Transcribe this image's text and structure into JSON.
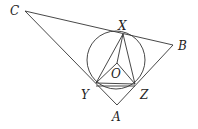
{
  "figure": {
    "labels": {
      "A": "A",
      "B": "B",
      "C": "C",
      "X": "X",
      "Y": "Y",
      "Z": "Z",
      "O": "O"
    },
    "points": {
      "A": [
        117,
        105
      ],
      "B": [
        173,
        45
      ],
      "C": [
        25,
        11
      ],
      "X": [
        123,
        34
      ],
      "Y": [
        96,
        83
      ],
      "Z": [
        135,
        84
      ],
      "O": [
        117,
        63
      ]
    },
    "circle": {
      "cx": 116,
      "cy": 60,
      "r": 29
    },
    "stroke_color": "#333333"
  }
}
